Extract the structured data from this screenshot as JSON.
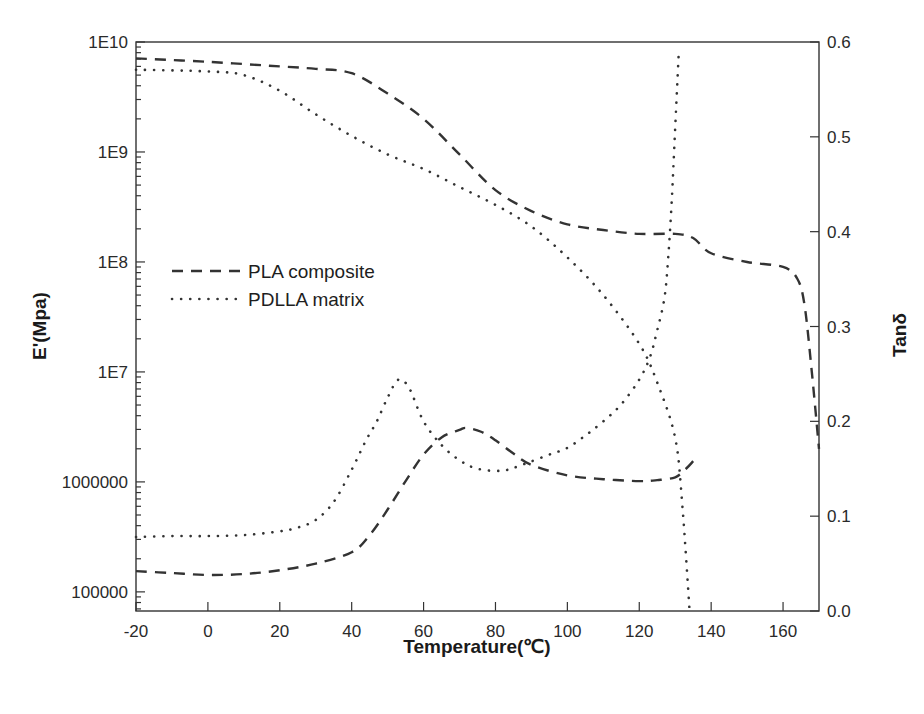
{
  "chart_data": {
    "type": "line",
    "title": "",
    "xlabel": "Temperature(℃)",
    "ylabel": "E'(Mpa)",
    "ylabel_right": "Tanδ",
    "xlim": [
      -20,
      170
    ],
    "ylim": [
      67000,
      10000000000
    ],
    "yscale": "log",
    "ylim_right": [
      0.0,
      0.6
    ],
    "grid": false,
    "x_ticks": [
      "-20",
      "0",
      "20",
      "40",
      "60",
      "80",
      "100",
      "120",
      "140",
      "160"
    ],
    "x_tick_values": [
      -20,
      0,
      20,
      40,
      60,
      80,
      100,
      120,
      140,
      160
    ],
    "y_ticks": [
      "1E10",
      "1E9",
      "1E8",
      "1E7",
      "1000000",
      "100000"
    ],
    "y_tick_values": [
      10000000000,
      1000000000,
      100000000,
      10000000,
      1000000,
      100000
    ],
    "y_right_ticks": [
      "0.6",
      "0.5",
      "0.4",
      "0.3",
      "0.2",
      "0.1",
      "0.0"
    ],
    "y_right_tick_values": [
      0.6,
      0.5,
      0.4,
      0.3,
      0.2,
      0.1,
      0.0
    ],
    "legend": {
      "placement": "center-left",
      "entries": [
        {
          "label": "PLA composite",
          "style": "dashed"
        },
        {
          "label": "PDLLA matrix",
          "style": "dotted"
        }
      ]
    },
    "series": [
      {
        "name": "PLA composite E'",
        "legend": "PLA composite",
        "style": "dashed",
        "axis": "left",
        "x": [
          -20,
          0,
          20,
          30,
          40,
          50,
          60,
          70,
          80,
          90,
          100,
          110,
          120,
          130,
          135,
          140,
          150,
          160,
          164,
          166,
          168,
          170
        ],
        "y": [
          7100000000.0,
          6600000000.0,
          6000000000.0,
          5700000000.0,
          5200000000.0,
          3400000000.0,
          2000000000.0,
          950000000.0,
          450000000.0,
          290000000.0,
          220000000.0,
          195000000.0,
          180000000.0,
          180000000.0,
          165000000.0,
          120000000.0,
          100000000.0,
          90000000.0,
          70000000.0,
          40000000.0,
          10000000.0,
          2000000.0
        ]
      },
      {
        "name": "PDLLA matrix E'",
        "legend": "PDLLA matrix",
        "style": "dotted",
        "axis": "left",
        "x": [
          -20,
          0,
          10,
          20,
          30,
          40,
          50,
          60,
          70,
          80,
          90,
          100,
          110,
          120,
          125,
          130,
          132,
          134
        ],
        "y": [
          5600000000.0,
          5400000000.0,
          5000000000.0,
          3600000000.0,
          2200000000.0,
          1400000000.0,
          950000000.0,
          700000000.0,
          480000000.0,
          330000000.0,
          210000000.0,
          110000000.0,
          50000000.0,
          18000000.0,
          8000000.0,
          2500000.0,
          600000.0,
          67000.0
        ]
      },
      {
        "name": "PLA composite Tanδ",
        "legend": "PLA composite",
        "style": "dashed",
        "axis": "right",
        "x": [
          -20,
          -10,
          0,
          10,
          20,
          30,
          40,
          45,
          50,
          55,
          60,
          65,
          70,
          72,
          76,
          80,
          85,
          90,
          100,
          110,
          120,
          125,
          130,
          133,
          135
        ],
        "y": [
          0.042,
          0.04,
          0.038,
          0.039,
          0.043,
          0.05,
          0.062,
          0.08,
          0.107,
          0.137,
          0.165,
          0.183,
          0.191,
          0.193,
          0.189,
          0.18,
          0.166,
          0.154,
          0.143,
          0.139,
          0.137,
          0.138,
          0.141,
          0.15,
          0.158
        ]
      },
      {
        "name": "PDLLA matrix Tanδ",
        "legend": "PDLLA matrix",
        "style": "dotted",
        "axis": "right",
        "x": [
          -20,
          -10,
          0,
          10,
          20,
          25,
          30,
          35,
          40,
          44,
          47,
          50,
          53,
          56,
          60,
          65,
          70,
          75,
          82,
          88,
          95,
          100,
          105,
          110,
          115,
          120,
          123,
          125,
          127,
          128,
          129,
          130,
          131
        ],
        "y": [
          0.078,
          0.079,
          0.079,
          0.08,
          0.084,
          0.088,
          0.096,
          0.115,
          0.149,
          0.18,
          0.2,
          0.225,
          0.244,
          0.235,
          0.2,
          0.175,
          0.159,
          0.15,
          0.148,
          0.155,
          0.165,
          0.172,
          0.185,
          0.2,
          0.218,
          0.244,
          0.268,
          0.296,
          0.33,
          0.37,
          0.43,
          0.51,
          0.59
        ]
      }
    ]
  }
}
